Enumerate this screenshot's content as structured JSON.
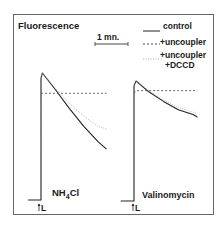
{
  "chart_data": {
    "type": "line",
    "title": "Fluorescence",
    "ylabel": "Fluorescence",
    "xlabel": "",
    "scale_bar": {
      "label": "1 mn.",
      "minutes": 1
    },
    "grid": false,
    "legend_placement": "top-right",
    "legend": [
      {
        "name": "control",
        "style": "solid"
      },
      {
        "name": "+uncoupler",
        "style": "dashed"
      },
      {
        "name_line1": "+uncoupler",
        "name_line2": "+DCCD",
        "name": "+uncoupler +DCCD",
        "style": "dotted"
      }
    ],
    "panels": [
      {
        "label": "NH4Cl",
        "label_main": "NH",
        "label_sub": "4",
        "label_tail": "Cl",
        "light_marker": "L",
        "note": "relative fluorescence, normalized: baseline = 0, peak = 1; time in minutes after light on (L)",
        "series": [
          {
            "name": "control",
            "x": [
              -0.45,
              0,
              0,
              0.05,
              0.5,
              1.0,
              1.5,
              2.0,
              2.3
            ],
            "y": [
              0,
              0,
              0.96,
              1.0,
              0.87,
              0.72,
              0.58,
              0.46,
              0.4
            ]
          },
          {
            "name": "+uncoupler",
            "x": [
              0,
              0.1,
              0.5,
              1.0,
              1.5,
              2.0,
              2.3
            ],
            "y": [
              0.84,
              0.84,
              0.84,
              0.84,
              0.84,
              0.84,
              0.84
            ]
          },
          {
            "name": "+uncoupler +DCCD",
            "x": [
              0,
              0.05,
              0.5,
              1.0,
              1.5,
              2.0,
              2.3
            ],
            "y": [
              0.96,
              1.0,
              0.88,
              0.76,
              0.66,
              0.58,
              0.56
            ]
          }
        ]
      },
      {
        "label": "Valinomycin",
        "light_marker": "L",
        "note": "relative fluorescence, normalized: baseline = 0, peak = 1; time in minutes after light on (L)",
        "series": [
          {
            "name": "control",
            "x": [
              -0.45,
              0,
              0,
              0.07,
              0.5,
              1.0,
              1.5,
              2.0,
              2.15
            ],
            "y": [
              0,
              0,
              0.96,
              1.0,
              0.91,
              0.83,
              0.76,
              0.72,
              0.7
            ]
          },
          {
            "name": "+uncoupler",
            "x": [
              0,
              0.1,
              0.5,
              1.0,
              1.5,
              2.0,
              2.15
            ],
            "y": [
              0.9,
              0.92,
              0.92,
              0.92,
              0.92,
              0.92,
              0.92
            ]
          },
          {
            "name": "+uncoupler +DCCD",
            "x": [
              0,
              0.07,
              0.5,
              1.0,
              1.5,
              2.0,
              2.15
            ],
            "y": [
              0.96,
              1.0,
              0.92,
              0.84,
              0.78,
              0.74,
              0.73
            ]
          }
        ]
      }
    ]
  }
}
